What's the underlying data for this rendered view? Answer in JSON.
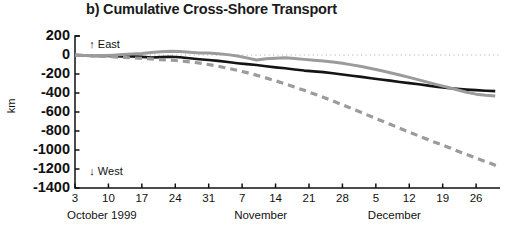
{
  "chart_data": {
    "type": "line",
    "title": "b) Cumulative Cross-Shore Transport",
    "xlabel": "",
    "ylabel": "km",
    "ylim": [
      -1400,
      200
    ],
    "yticks": [
      200,
      0,
      -200,
      -400,
      -600,
      -800,
      -1000,
      -1200,
      -1400
    ],
    "ytick_labels": [
      "200",
      "0",
      "-200",
      "-400",
      "-600",
      "-800",
      "-1000",
      "-1200",
      "-1400"
    ],
    "grid": false,
    "zero_reference_line": {
      "value": 0,
      "style": "dotted",
      "color": "#b4b4b4"
    },
    "annotations": [
      {
        "text": "↑ East",
        "x_day": 6,
        "y": 110
      },
      {
        "text": "↓ West",
        "x_day": 6,
        "y": -1230
      }
    ],
    "x_axis": {
      "start_day": 3,
      "end_day": 92,
      "tick_days": [
        3,
        10,
        17,
        24,
        31,
        38,
        45,
        52,
        59,
        66,
        73,
        80,
        87
      ],
      "tick_labels": [
        "3",
        "10",
        "17",
        "24",
        "31",
        "7",
        "14",
        "21",
        "28",
        "5",
        "12",
        "19",
        "26"
      ],
      "month_labels": [
        {
          "text": "October 1999",
          "day": 3
        },
        {
          "text": "November",
          "day": 38
        },
        {
          "text": "December",
          "day": 66
        }
      ]
    },
    "series": [
      {
        "name": "black-solid",
        "color": "#141414",
        "style": "solid",
        "width": 2.6,
        "x": [
          3,
          5,
          7,
          9,
          11,
          13,
          15,
          17,
          19,
          21,
          23,
          25,
          27,
          29,
          31,
          33,
          35,
          37,
          39,
          41,
          43,
          45,
          47,
          49,
          51,
          53,
          55,
          57,
          59,
          61,
          63,
          65,
          67,
          69,
          71,
          73,
          75,
          77,
          79,
          81,
          83,
          85,
          87,
          89,
          91
        ],
        "y": [
          0,
          -5,
          -10,
          -8,
          -12,
          -16,
          -14,
          -20,
          -26,
          -22,
          -18,
          -24,
          -34,
          -44,
          -52,
          -62,
          -74,
          -86,
          -96,
          -106,
          -118,
          -130,
          -140,
          -152,
          -164,
          -172,
          -180,
          -192,
          -206,
          -218,
          -230,
          -244,
          -258,
          -270,
          -284,
          -296,
          -308,
          -322,
          -336,
          -348,
          -356,
          -364,
          -370,
          -376,
          -380
        ]
      },
      {
        "name": "gray-solid",
        "color": "#9b9b9b",
        "style": "solid",
        "width": 3.0,
        "x": [
          3,
          5,
          7,
          9,
          11,
          13,
          15,
          17,
          19,
          21,
          23,
          25,
          27,
          29,
          31,
          33,
          35,
          37,
          39,
          41,
          43,
          45,
          47,
          49,
          51,
          53,
          55,
          57,
          59,
          61,
          63,
          65,
          67,
          69,
          71,
          73,
          75,
          77,
          79,
          81,
          83,
          85,
          87,
          89,
          91
        ],
        "y": [
          0,
          -4,
          -8,
          -6,
          -2,
          4,
          10,
          16,
          26,
          34,
          40,
          36,
          28,
          22,
          20,
          14,
          4,
          -10,
          -30,
          -52,
          -40,
          -34,
          -30,
          -36,
          -46,
          -56,
          -64,
          -74,
          -88,
          -104,
          -122,
          -142,
          -164,
          -186,
          -210,
          -236,
          -262,
          -288,
          -314,
          -340,
          -366,
          -392,
          -412,
          -424,
          -432
        ]
      },
      {
        "name": "gray-dashed",
        "color": "#9b9b9b",
        "style": "dashed",
        "width": 3.2,
        "x": [
          3,
          6,
          9,
          12,
          15,
          18,
          21,
          24,
          27,
          30,
          33,
          36,
          39,
          42,
          45,
          48,
          51,
          54,
          57,
          60,
          63,
          66,
          69,
          72,
          75,
          78,
          81,
          84,
          87,
          90,
          92
        ],
        "y": [
          0,
          -6,
          -14,
          -22,
          -30,
          -38,
          -48,
          -58,
          -72,
          -92,
          -118,
          -150,
          -186,
          -226,
          -272,
          -320,
          -372,
          -426,
          -484,
          -544,
          -606,
          -668,
          -730,
          -792,
          -852,
          -912,
          -968,
          -1028,
          -1086,
          -1140,
          -1180
        ]
      }
    ]
  }
}
